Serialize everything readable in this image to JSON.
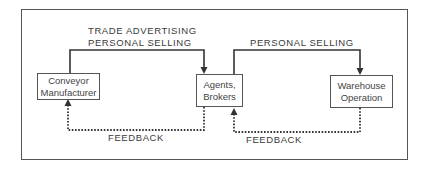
{
  "diagram": {
    "nodes": [
      {
        "id": "conveyor",
        "label_lines": [
          "Conveyor",
          "Manufacturer"
        ]
      },
      {
        "id": "agents",
        "label_lines": [
          "Agents,",
          "Brokers"
        ]
      },
      {
        "id": "warehouse",
        "label_lines": [
          "Warehouse",
          "Operation"
        ]
      }
    ],
    "edges": [
      {
        "from": "conveyor",
        "to": "agents",
        "style": "solid",
        "label_lines": [
          "TRADE ADVERTISING",
          "PERSONAL SELLING"
        ]
      },
      {
        "from": "agents",
        "to": "warehouse",
        "style": "solid",
        "label_lines": [
          "PERSONAL SELLING"
        ]
      },
      {
        "from": "agents",
        "to": "conveyor",
        "style": "dotted",
        "label_lines": [
          "FEEDBACK"
        ]
      },
      {
        "from": "warehouse",
        "to": "agents",
        "style": "dotted",
        "label_lines": [
          "FEEDBACK"
        ]
      }
    ],
    "colors": {
      "line": "#333333",
      "text": "#3a3a3a",
      "background": "#ffffff"
    }
  }
}
